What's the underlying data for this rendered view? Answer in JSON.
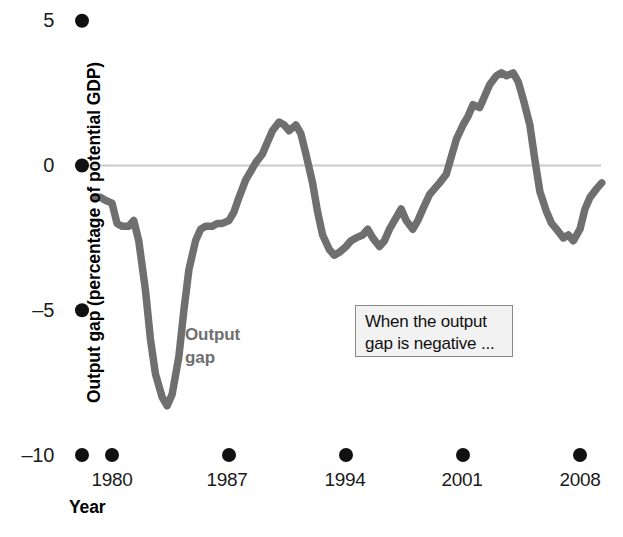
{
  "chart_data": {
    "type": "line",
    "title": "",
    "xlabel": "Year",
    "ylabel": "Output gap (percentage of potential GDP)",
    "xlim": [
      1979.0,
      2009.3
    ],
    "ylim": [
      -10,
      5
    ],
    "xticks": [
      1980,
      1987,
      1994,
      2001,
      2008
    ],
    "xtick_labels": [
      "1980",
      "1987",
      "1994",
      "2001",
      "2008"
    ],
    "yticks": [
      5,
      0,
      -5,
      -10
    ],
    "ytick_labels": [
      "5",
      "0",
      "-5",
      "-10"
    ],
    "grid": false,
    "zero_line": true,
    "legend_position": "inline",
    "series": [
      {
        "name": "Output gap",
        "color": "#706f70",
        "x": [
          1979.0,
          1979.3,
          1979.6,
          1980.0,
          1980.3,
          1980.6,
          1981.0,
          1981.3,
          1981.6,
          1982.0,
          1982.3,
          1982.6,
          1983.0,
          1983.3,
          1983.6,
          1984.0,
          1984.3,
          1984.6,
          1985.0,
          1985.3,
          1985.6,
          1986.0,
          1986.3,
          1986.6,
          1987.0,
          1987.3,
          1987.6,
          1988.0,
          1988.3,
          1988.6,
          1989.0,
          1989.3,
          1989.6,
          1990.0,
          1990.3,
          1990.6,
          1991.0,
          1991.3,
          1991.6,
          1992.0,
          1992.3,
          1992.6,
          1993.0,
          1993.3,
          1993.6,
          1994.0,
          1994.3,
          1994.6,
          1995.0,
          1995.3,
          1995.6,
          1996.0,
          1996.3,
          1996.6,
          1997.0,
          1997.3,
          1997.6,
          1998.0,
          1998.3,
          1998.6,
          1999.0,
          1999.3,
          1999.6,
          2000.0,
          2000.3,
          2000.6,
          2001.0,
          2001.3,
          2001.6,
          2002.0,
          2002.3,
          2002.6,
          2003.0,
          2003.3,
          2003.6,
          2004.0,
          2004.3,
          2004.6,
          2005.0,
          2005.3,
          2005.6,
          2006.0,
          2006.3,
          2006.6,
          2007.0,
          2007.3,
          2007.6,
          2008.0,
          2008.3,
          2008.6,
          2009.0,
          2009.3
        ],
        "y": [
          -1.1,
          -1.1,
          -1.2,
          -1.3,
          -2.0,
          -2.1,
          -2.1,
          -1.9,
          -2.6,
          -4.3,
          -6.0,
          -7.2,
          -8.0,
          -8.3,
          -7.9,
          -6.6,
          -5.0,
          -3.6,
          -2.6,
          -2.2,
          -2.1,
          -2.1,
          -2.0,
          -2.0,
          -1.9,
          -1.6,
          -1.1,
          -0.5,
          -0.2,
          0.1,
          0.4,
          0.8,
          1.2,
          1.5,
          1.4,
          1.2,
          1.4,
          1.1,
          0.4,
          -0.6,
          -1.6,
          -2.4,
          -2.9,
          -3.1,
          -3.0,
          -2.8,
          -2.6,
          -2.5,
          -2.4,
          -2.2,
          -2.5,
          -2.8,
          -2.6,
          -2.2,
          -1.8,
          -1.5,
          -1.9,
          -2.2,
          -1.9,
          -1.5,
          -1.0,
          -0.8,
          -0.6,
          -0.3,
          0.3,
          0.9,
          1.4,
          1.7,
          2.1,
          2.0,
          2.4,
          2.8,
          3.1,
          3.2,
          3.1,
          3.2,
          2.9,
          2.3,
          1.4,
          0.2,
          -0.9,
          -1.6,
          -2.0,
          -2.2,
          -2.5,
          -2.4,
          -2.6,
          -2.2,
          -1.5,
          -1.1,
          -0.8,
          -0.6
        ]
      }
    ],
    "series_inline_label": {
      "text": "Output\ngap",
      "x": 185,
      "y": 324,
      "color": "#706f70"
    },
    "annotations": [
      {
        "text": "When the output\ngap is negative ...",
        "box": true
      }
    ]
  },
  "axes": {
    "y_title": "Output gap (percentage of potential GDP)",
    "x_title": "Year",
    "y_ticks": [
      {
        "label": "5",
        "value": 5
      },
      {
        "label": "0",
        "value": 0
      },
      {
        "label": "–5",
        "value": -5
      },
      {
        "label": "–10",
        "value": -10
      }
    ],
    "x_ticks": [
      {
        "label": "1980",
        "value": 1980
      },
      {
        "label": "1987",
        "value": 1987
      },
      {
        "label": "1994",
        "value": 1994
      },
      {
        "label": "2001",
        "value": 2001
      },
      {
        "label": "2008",
        "value": 2008
      }
    ]
  },
  "series_label": {
    "text": "Output\ngap"
  },
  "annotation": {
    "text": "When the output\ngap is negative ..."
  },
  "colors": {
    "series": "#706f70",
    "zero_line": "#c9c9c9",
    "tick_dot": "#111111",
    "annotation_bg": "#f2f2f2",
    "annotation_border": "#8a8a8a",
    "text": "#000000"
  }
}
